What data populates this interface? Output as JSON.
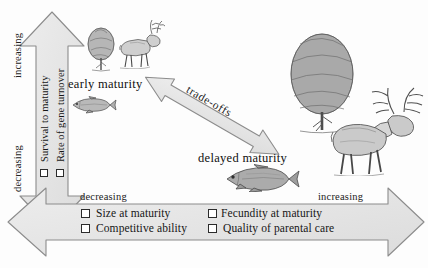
{
  "figure": {
    "background_color": "#fdfdfd",
    "arrow_fill": "#e6e6e6",
    "arrow_stroke": "#8a8a8a",
    "ink_color": "#1a1a1a"
  },
  "vertical_axis": {
    "name": "vertical-axis-arrow",
    "top_label": "increasing",
    "bottom_label": "decreasing",
    "items": [
      {
        "label": "Survival to maturity",
        "checked": false
      },
      {
        "label": "Rate of gene turnover",
        "checked": false
      }
    ]
  },
  "horizontal_axis": {
    "name": "horizontal-axis-arrow",
    "left_label": "decreasing",
    "right_label": "increasing",
    "items_left": [
      {
        "label": "Size at maturity",
        "checked": false
      },
      {
        "label": "Competitive ability",
        "checked": false
      }
    ],
    "items_right": [
      {
        "label": "Fecundity at maturity",
        "checked": false
      },
      {
        "label": "Quality of parental care",
        "checked": false
      }
    ]
  },
  "tradeoff_arrow": {
    "name": "tradeoffs-arrow",
    "label": "trade-offs",
    "direction": "double-headed"
  },
  "stages": [
    {
      "id": "early",
      "label": "early maturity",
      "organisms": [
        "tree-small-icon",
        "deer-small-icon",
        "fish-small-icon"
      ]
    },
    {
      "id": "delayed",
      "label": "delayed maturity",
      "organisms": [
        "tree-large-icon",
        "deer-large-icon",
        "fish-large-icon"
      ]
    }
  ]
}
